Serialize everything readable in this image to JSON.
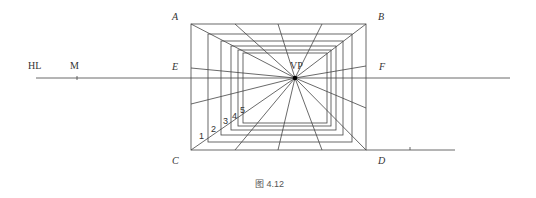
{
  "figure": {
    "caption": "图 4.12",
    "labels": {
      "hl": "HL",
      "m": "M",
      "vp": "VP",
      "a": "A",
      "b": "B",
      "c": "C",
      "d": "D",
      "e": "E",
      "f": "F"
    },
    "depth_numbers": [
      "1",
      "2",
      "3",
      "4",
      "5"
    ],
    "line_color": "#333333"
  }
}
